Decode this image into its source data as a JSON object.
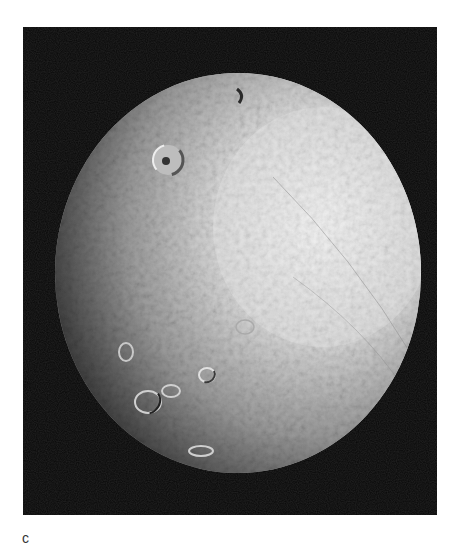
{
  "figure": {
    "panel_label": "c",
    "colors": {
      "background": "#ffffff",
      "space": "#050505",
      "highlight": "#ececec",
      "midtone": "#9a9a9a",
      "shadow": "#2a2a2a"
    }
  }
}
